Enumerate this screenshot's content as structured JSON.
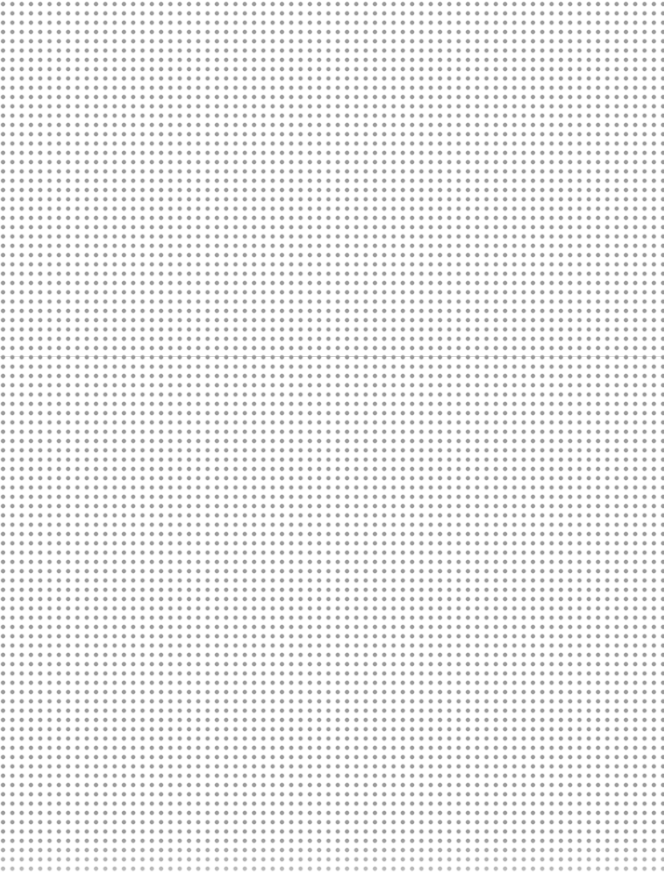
{
  "page": {
    "type": "dot-grid-paper",
    "background_color": "#ffffff",
    "dot_color": "#9a9a9a",
    "dot_spacing_px": 9.3,
    "fold_line": {
      "visible": true,
      "y_px": 356,
      "color": "#a0a0a0"
    }
  }
}
